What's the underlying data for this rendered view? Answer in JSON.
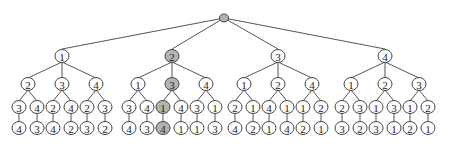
{
  "diagram": {
    "type": "permutation-tree",
    "colors": {
      "default_fill": "#ffffff",
      "highlight_fill": "#b3b3b3",
      "stroke": "#444444"
    },
    "root": {
      "label": "",
      "highlighted": true
    },
    "tree": [
      {
        "label": "1",
        "children": [
          {
            "label": "2",
            "children": [
              {
                "label": "3",
                "children": [
                  {
                    "label": "4"
                  }
                ]
              },
              {
                "label": "4",
                "children": [
                  {
                    "label": "3"
                  }
                ]
              }
            ]
          },
          {
            "label": "3",
            "children": [
              {
                "label": "2",
                "children": [
                  {
                    "label": "4"
                  }
                ]
              },
              {
                "label": "4",
                "children": [
                  {
                    "label": "2"
                  }
                ]
              }
            ]
          },
          {
            "label": "4",
            "children": [
              {
                "label": "2",
                "children": [
                  {
                    "label": "3"
                  }
                ]
              },
              {
                "label": "3",
                "children": [
                  {
                    "label": "2"
                  }
                ]
              }
            ]
          }
        ]
      },
      {
        "label": "2",
        "highlighted": true,
        "children": [
          {
            "label": "1",
            "children": [
              {
                "label": "3",
                "children": [
                  {
                    "label": "4"
                  }
                ]
              },
              {
                "label": "4",
                "children": [
                  {
                    "label": "3"
                  }
                ]
              }
            ]
          },
          {
            "label": "3",
            "highlighted": true,
            "children": [
              {
                "label": "1",
                "highlighted": true,
                "children": [
                  {
                    "label": "4",
                    "highlighted": true
                  }
                ]
              },
              {
                "label": "4",
                "children": [
                  {
                    "label": "1"
                  }
                ]
              }
            ]
          },
          {
            "label": "4",
            "children": [
              {
                "label": "3",
                "children": [
                  {
                    "label": "1"
                  }
                ]
              },
              {
                "label": "1",
                "children": [
                  {
                    "label": "3"
                  }
                ]
              }
            ]
          }
        ]
      },
      {
        "label": "3",
        "children": [
          {
            "label": "1",
            "children": [
              {
                "label": "2",
                "children": [
                  {
                    "label": "4"
                  }
                ]
              },
              {
                "label": "1",
                "children": [
                  {
                    "label": "2"
                  }
                ]
              }
            ]
          },
          {
            "label": "2",
            "children": [
              {
                "label": "4",
                "children": [
                  {
                    "label": "1"
                  }
                ]
              },
              {
                "label": "1",
                "children": [
                  {
                    "label": "4"
                  }
                ]
              }
            ]
          },
          {
            "label": "4",
            "children": [
              {
                "label": "1",
                "children": [
                  {
                    "label": "2"
                  }
                ]
              },
              {
                "label": "2",
                "children": [
                  {
                    "label": "1"
                  }
                ]
              }
            ]
          }
        ]
      },
      {
        "label": "4",
        "children": [
          {
            "label": "1",
            "children": [
              {
                "label": "2",
                "children": [
                  {
                    "label": "3"
                  }
                ]
              },
              {
                "label": "3",
                "children": [
                  {
                    "label": "2"
                  }
                ]
              }
            ]
          },
          {
            "label": "2",
            "children": [
              {
                "label": "1",
                "children": [
                  {
                    "label": "3"
                  }
                ]
              },
              {
                "label": "3",
                "children": [
                  {
                    "label": "1"
                  }
                ]
              }
            ]
          },
          {
            "label": "3",
            "children": [
              {
                "label": "1",
                "children": [
                  {
                    "label": "2"
                  }
                ]
              },
              {
                "label": "2",
                "children": [
                  {
                    "label": "1"
                  }
                ]
              }
            ]
          }
        ]
      }
    ]
  }
}
